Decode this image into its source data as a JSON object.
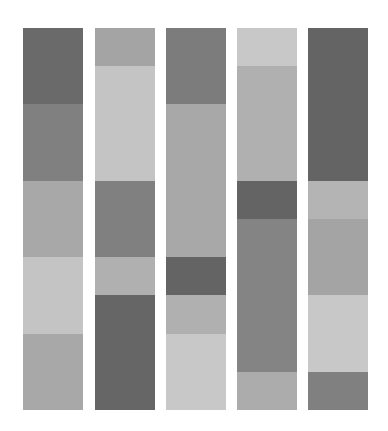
{
  "chart_data": {
    "type": "bar",
    "subtype": "stacked-segments",
    "title": "",
    "xlabel": "",
    "ylabel": "",
    "grid": false,
    "legend": null,
    "plot_area": {
      "top": 28,
      "bottom": 410,
      "height": 382
    },
    "unit": "fraction of column height (1 unit = 1/10 column, ~38.2px)",
    "categories": [
      "Column 1",
      "Column 2",
      "Column 3",
      "Column 4",
      "Column 5"
    ],
    "columns": [
      {
        "name": "Column 1",
        "x": 23,
        "width": 60,
        "segments": [
          {
            "start": 0,
            "size": 2,
            "color": "#6a6a6a"
          },
          {
            "start": 2,
            "size": 2,
            "color": "#808080"
          },
          {
            "start": 4,
            "size": 2,
            "color": "#a8a8a8"
          },
          {
            "start": 6,
            "size": 2,
            "color": "#c4c4c4"
          },
          {
            "start": 8,
            "size": 2,
            "color": "#a8a8a8"
          }
        ]
      },
      {
        "name": "Column 2",
        "x": 95,
        "width": 60,
        "segments": [
          {
            "start": 0,
            "size": 1,
            "color": "#a4a4a4"
          },
          {
            "start": 1,
            "size": 3,
            "color": "#c4c4c4"
          },
          {
            "start": 4,
            "size": 2,
            "color": "#808080"
          },
          {
            "start": 6,
            "size": 1,
            "color": "#b0b0b0"
          },
          {
            "start": 7,
            "size": 3,
            "color": "#666666"
          }
        ]
      },
      {
        "name": "Column 3",
        "x": 166,
        "width": 60,
        "segments": [
          {
            "start": 0,
            "size": 2,
            "color": "#7c7c7c"
          },
          {
            "start": 2,
            "size": 4,
            "color": "#a8a8a8"
          },
          {
            "start": 6,
            "size": 1,
            "color": "#646464"
          },
          {
            "start": 7,
            "size": 1,
            "color": "#b0b0b0"
          },
          {
            "start": 8,
            "size": 2,
            "color": "#c8c8c8"
          }
        ]
      },
      {
        "name": "Column 4",
        "x": 237,
        "width": 60,
        "segments": [
          {
            "start": 0,
            "size": 1,
            "color": "#c8c8c8"
          },
          {
            "start": 1,
            "size": 3,
            "color": "#b0b0b0"
          },
          {
            "start": 4,
            "size": 1,
            "color": "#646464"
          },
          {
            "start": 5,
            "size": 4,
            "color": "#848484"
          },
          {
            "start": 9,
            "size": 1,
            "color": "#acacac"
          }
        ]
      },
      {
        "name": "Column 5",
        "x": 308,
        "width": 60,
        "segments": [
          {
            "start": 0,
            "size": 4,
            "color": "#646464"
          },
          {
            "start": 4,
            "size": 1,
            "color": "#b4b4b4"
          },
          {
            "start": 5,
            "size": 2,
            "color": "#a4a4a4"
          },
          {
            "start": 7,
            "size": 2,
            "color": "#c8c8c8"
          },
          {
            "start": 9,
            "size": 1,
            "color": "#808080"
          }
        ]
      }
    ],
    "series": [
      {
        "name": "Segment 1",
        "values": [
          2,
          1,
          2,
          1,
          4
        ]
      },
      {
        "name": "Segment 2",
        "values": [
          2,
          3,
          4,
          3,
          1
        ]
      },
      {
        "name": "Segment 3",
        "values": [
          2,
          2,
          1,
          1,
          2
        ]
      },
      {
        "name": "Segment 4",
        "values": [
          2,
          1,
          1,
          4,
          2
        ]
      },
      {
        "name": "Segment 5",
        "values": [
          2,
          3,
          2,
          1,
          1
        ]
      }
    ],
    "ylim": [
      0,
      10
    ]
  }
}
